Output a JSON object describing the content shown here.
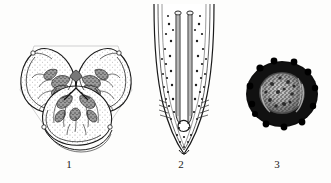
{
  "plate": {
    "background_color": "#fdfdfc",
    "ink_color": "#1a1a1a",
    "figures": [
      {
        "id": "figure-1",
        "caption": "1",
        "subject": "en-face-view-cross-section",
        "description": "Trilobed head-on (en face) view with three stippled lips and dark radiating internal papillae around a triradiate central mouth opening"
      },
      {
        "id": "figure-2",
        "caption": "2",
        "subject": "tail-with-spicules",
        "description": "Tapering tail region in lateral view containing two elongate parallel spicules and scattered stippled dots within the body wall"
      },
      {
        "id": "figure-3",
        "caption": "3",
        "subject": "egg",
        "description": "Oval egg with thick dark shell and granular mottled interior"
      }
    ]
  }
}
